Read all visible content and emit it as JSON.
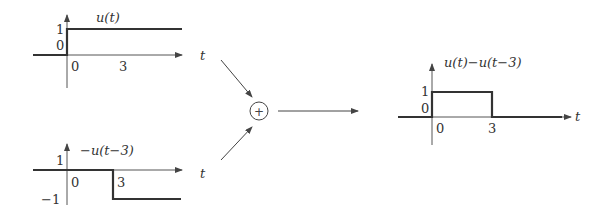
{
  "diagram": {
    "top_plot": {
      "label": "u(t)",
      "y_ticks": [
        "1",
        "0"
      ],
      "x_ticks": [
        "0",
        "3"
      ],
      "axis_var": "t"
    },
    "bottom_plot": {
      "label": "−u(t−3)",
      "y_ticks": [
        "1",
        "−1"
      ],
      "x_ticks": [
        "0",
        "3"
      ],
      "axis_var": "t"
    },
    "summer": {
      "symbol": "+"
    },
    "result_plot": {
      "label": "u(t)−u(t−3)",
      "y_ticks": [
        "1",
        "0"
      ],
      "x_ticks": [
        "0",
        "3"
      ],
      "axis_var": "t"
    }
  }
}
